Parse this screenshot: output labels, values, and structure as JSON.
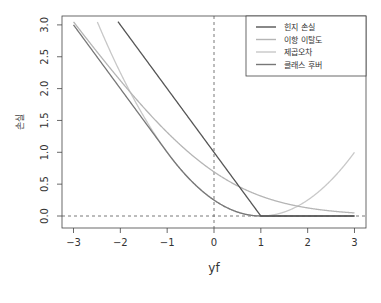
{
  "chart_data": {
    "type": "line",
    "title": "",
    "xlabel": "yf",
    "ylabel": "손실",
    "xlim": [
      -3,
      3
    ],
    "ylim": [
      0,
      3
    ],
    "x_ticks": [
      "−3",
      "−2",
      "−1",
      "0",
      "1",
      "2",
      "3"
    ],
    "y_ticks": [
      "0.0",
      "0.5",
      "1.0",
      "1.5",
      "2.0",
      "2.5",
      "3.0"
    ],
    "grid": false,
    "legend_position": "top-right",
    "reference_lines": [
      {
        "orientation": "vertical",
        "value": 0,
        "style": "dashed"
      },
      {
        "orientation": "horizontal",
        "value": 0,
        "style": "dashed"
      }
    ],
    "series": [
      {
        "name": "힌지 손실",
        "color": "#555555",
        "formula": "max(0, 1 - yf)",
        "x": [
          -2,
          -1,
          0,
          1,
          2,
          3
        ],
        "values": [
          3,
          2,
          1,
          0,
          0,
          0
        ]
      },
      {
        "name": "이항 이탈도",
        "color": "#b5b5b5",
        "formula": "log(1 + exp(-yf))",
        "x": [
          -3,
          -2,
          -1,
          0,
          1,
          2,
          3
        ],
        "values": [
          3.05,
          2.13,
          1.31,
          0.69,
          0.31,
          0.13,
          0.05
        ]
      },
      {
        "name": "제곱오차",
        "color": "#c8c8c8",
        "formula": "(1 - yf)^2 / 4",
        "x": [
          -2.46,
          -2,
          -1,
          0,
          1,
          2,
          3
        ],
        "values": [
          3.0,
          2.25,
          1.0,
          0.25,
          0,
          0.25,
          1.0
        ]
      },
      {
        "name": "클래스 후버",
        "color": "#777777",
        "formula": "-yf if yf<-1; (1-yf)^2/4 if -1<=yf<=1; 0 otherwise",
        "x": [
          -3,
          -2,
          -1,
          0,
          1,
          2,
          3
        ],
        "values": [
          3,
          2,
          1,
          0.25,
          0,
          0,
          0
        ]
      }
    ]
  }
}
